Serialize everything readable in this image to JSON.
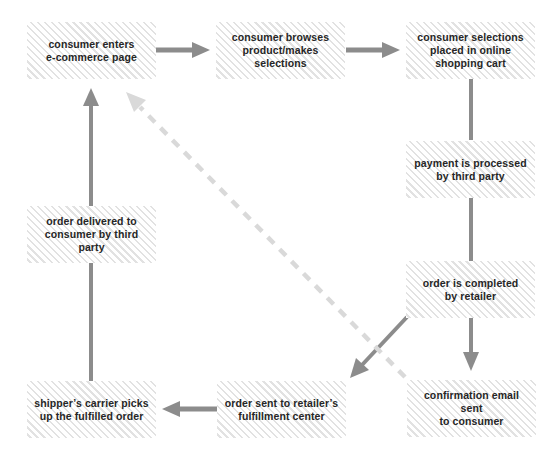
{
  "diagram": {
    "title": "",
    "colors": {
      "arrow": "#8c8c8c",
      "dashed_arrow": "#d9d9d9",
      "hatch": "#e2e2e2",
      "text": "#262626"
    },
    "nodes": [
      {
        "id": "enter",
        "label": "consumer enters e-commerce page",
        "lines": [
          "consumer enters",
          "e-commerce page"
        ]
      },
      {
        "id": "browse",
        "label": "consumer browses product/makes selections",
        "lines": [
          "consumer browses",
          "product/makes",
          "selections"
        ]
      },
      {
        "id": "cart",
        "label": "consumer selections placed in online shopping cart",
        "lines": [
          "consumer selections",
          "placed in online",
          "shopping cart"
        ]
      },
      {
        "id": "payment",
        "label": "payment is processed by third party",
        "lines": [
          "payment is processed",
          "by third party"
        ]
      },
      {
        "id": "completed",
        "label": "order is completed by retailer",
        "lines": [
          "order is completed",
          "by retailer"
        ]
      },
      {
        "id": "fulfillment",
        "label": "order sent to retailer's fulfillment center",
        "lines": [
          "order sent to retailer’s",
          "fulfillment center"
        ]
      },
      {
        "id": "shipper",
        "label": "shipper's carrier picks up the fulfilled order",
        "lines": [
          "shipper’s carrier picks",
          "up the fulfilled order"
        ]
      },
      {
        "id": "email",
        "label": "confirmation email sent to consumer",
        "lines": [
          "confirmation email sent",
          "to consumer"
        ]
      },
      {
        "id": "delivered",
        "label": "order delivered to consumer by third party",
        "lines": [
          "order delivered to",
          "consumer by third party"
        ]
      }
    ],
    "edges": [
      {
        "from": "enter",
        "to": "browse",
        "style": "solid"
      },
      {
        "from": "browse",
        "to": "cart",
        "style": "solid"
      },
      {
        "from": "cart",
        "to": "payment",
        "style": "solid-line"
      },
      {
        "from": "payment",
        "to": "completed",
        "style": "solid-line"
      },
      {
        "from": "completed",
        "to": "email",
        "style": "solid"
      },
      {
        "from": "completed",
        "to": "fulfillment",
        "style": "solid"
      },
      {
        "from": "fulfillment",
        "to": "shipper",
        "style": "solid"
      },
      {
        "from": "shipper",
        "to": "delivered",
        "style": "solid-line"
      },
      {
        "from": "delivered",
        "to": "enter",
        "style": "solid"
      },
      {
        "from": "email",
        "to": "enter",
        "style": "dashed"
      }
    ]
  }
}
